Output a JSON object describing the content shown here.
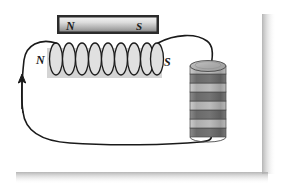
{
  "figure": {
    "background_color": "#ffffff",
    "canvas": {
      "width": 287,
      "height": 195
    },
    "shadow_color": "#b8b8b8"
  },
  "bar_magnet": {
    "name": "bar-magnet",
    "north_label": "N",
    "south_label": "S",
    "border_color": "#2b2b2b",
    "fill_light": "#e8e8e8",
    "fill_dark": "#9a9a9a",
    "x": 57,
    "y": 15,
    "width": 102,
    "height": 19
  },
  "solenoid": {
    "name": "solenoid-coil",
    "north_label": "N",
    "south_label": "S",
    "turns": 9,
    "core_fill": "#d2d2d2",
    "loop_fill": "#dedede",
    "loop_stroke": "#1a1a1a",
    "core_x": 47,
    "core_y": 48,
    "core_width": 115,
    "core_height": 30
  },
  "voltaic_pile": {
    "name": "voltaic-pile-battery",
    "disc_count": 8,
    "top_fill": "#b0b0b0",
    "light_band": "#b4b4b4",
    "dark_band": "#6f6f6f",
    "stroke_color": "#4a4a4a",
    "x": 190,
    "y": 66,
    "width": 36,
    "height": 72
  },
  "circuit_wire": {
    "name": "circuit-wire",
    "stroke_color": "#1a1a1a",
    "stroke_width": 1.5
  },
  "current_arrow": {
    "name": "current-direction-arrow",
    "direction": "up",
    "color": "#1a1a1a",
    "x": 22,
    "y_top": 76,
    "y_bottom": 109
  }
}
